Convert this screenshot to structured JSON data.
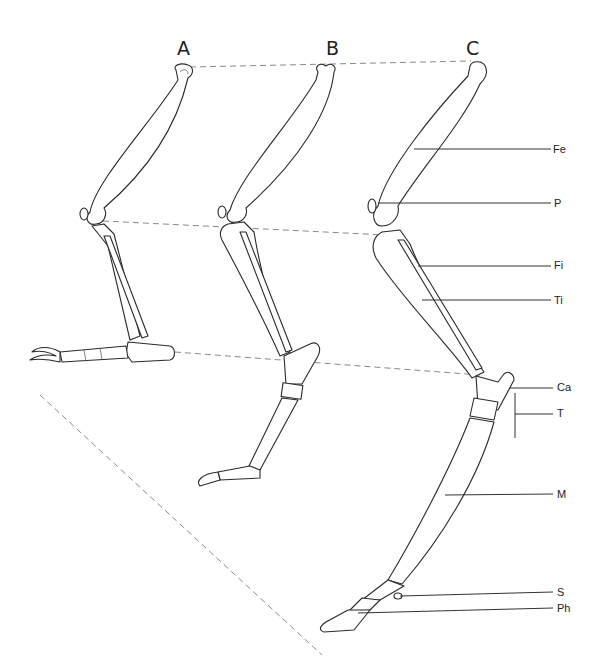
{
  "figure": {
    "background": "#ffffff",
    "line_color": "#2a2a2a",
    "dash_color": "#8a8a8a",
    "headings": [
      {
        "id": "A",
        "text": "A",
        "x": 177,
        "y": 38
      },
      {
        "id": "B",
        "text": "B",
        "x": 326,
        "y": 38
      },
      {
        "id": "C",
        "text": "C",
        "x": 466,
        "y": 38
      }
    ],
    "labels": [
      {
        "id": "Fe",
        "text": "Fe",
        "x": 553,
        "y": 143,
        "line": [
          414,
          149,
          551,
          149
        ],
        "meaning": "femur"
      },
      {
        "id": "P",
        "text": "P",
        "x": 554,
        "y": 197,
        "line": [
          378,
          203,
          551,
          203
        ],
        "meaning": "patella"
      },
      {
        "id": "Fi",
        "text": "Fi",
        "x": 554,
        "y": 259,
        "line": [
          418,
          266,
          551,
          266
        ],
        "meaning": "fibula"
      },
      {
        "id": "Ti",
        "text": "Ti",
        "x": 554,
        "y": 294,
        "line": [
          422,
          300,
          551,
          300
        ],
        "meaning": "tibia"
      },
      {
        "id": "Ca",
        "text": "Ca",
        "x": 557,
        "y": 381,
        "line": [
          510,
          388,
          553,
          388
        ],
        "meaning": "calcaneus"
      },
      {
        "id": "T",
        "text": "T",
        "x": 557,
        "y": 407,
        "line": [
          515,
          414,
          553,
          414
        ],
        "meaning": "tarsals"
      },
      {
        "id": "M",
        "text": "M",
        "x": 557,
        "y": 488,
        "line": [
          445,
          495,
          553,
          494
        ],
        "meaning": "metatarsal"
      },
      {
        "id": "S",
        "text": "S",
        "x": 557,
        "y": 586,
        "line": [
          400,
          596,
          553,
          592
        ],
        "meaning": "sesamoid"
      },
      {
        "id": "Ph",
        "text": "Ph",
        "x": 557,
        "y": 602,
        "line": [
          358,
          613,
          553,
          608
        ],
        "meaning": "phalanges"
      }
    ],
    "bracket_T": [
      515,
      393,
      515,
      438
    ],
    "dashed_lines": [
      [
        190,
        67,
        471,
        61
      ],
      [
        103,
        221,
        385,
        235
      ],
      [
        175,
        352,
        480,
        375
      ],
      [
        40,
        395,
        322,
        655
      ]
    ]
  }
}
